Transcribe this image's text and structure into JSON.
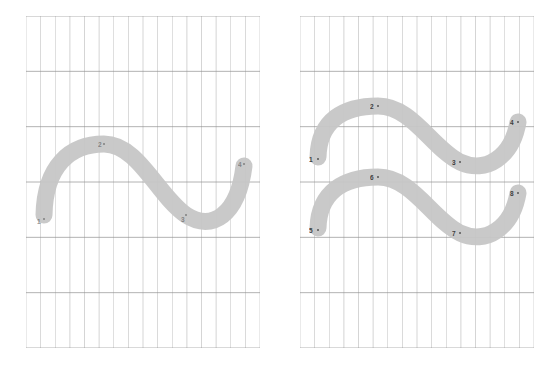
{
  "figure": {
    "type": "diagram",
    "background_color": "#ffffff",
    "grid": {
      "minor_line_color": "#c9c9c9",
      "major_line_color": "#8f8f8f",
      "border_color": "#8f8f8f",
      "minor_line_width": 0.5,
      "major_line_width": 0.8
    },
    "stroke": {
      "fill_color": "#c6c6c6",
      "edge_color": "#bdbdbd",
      "width_px": 17
    }
  },
  "panels": [
    {
      "id": "left-panel",
      "name": "left-panel",
      "x": 26,
      "y": 16,
      "width": 234,
      "height": 332,
      "columns": 16,
      "rows": 6,
      "curves": [
        {
          "id": "left-curve-1",
          "name": "s-curve",
          "path": "M 18,199 C 19,150 44,128 78,128 C 112,128 132,180 160,199 C 186,216 212,199 218,150",
          "points": [
            {
              "label": "1",
              "x": 18,
              "y": 203,
              "label_x": 11,
              "label_y": 203,
              "faint": true
            },
            {
              "label": "2",
              "x": 78,
              "y": 128,
              "label_x": 72,
              "label_y": 126,
              "faint": true
            },
            {
              "label": "3",
              "x": 160,
              "y": 199,
              "label_x": 155,
              "label_y": 201,
              "faint": true
            },
            {
              "label": "4",
              "x": 218,
              "y": 148,
              "label_x": 212,
              "label_y": 146,
              "faint": true
            }
          ]
        }
      ]
    },
    {
      "id": "right-panel",
      "name": "right-panel",
      "x": 300,
      "y": 16,
      "width": 234,
      "height": 332,
      "columns": 16,
      "rows": 6,
      "curves": [
        {
          "id": "right-curve-upper",
          "name": "s-curve-upper",
          "path": "M 18,141 C 19,104 44,90 78,90 C 112,90 132,132 160,146 C 186,158 212,141 218,106",
          "points": [
            {
              "label": "1",
              "x": 18,
              "y": 143,
              "label_x": 9,
              "label_y": 141,
              "faint": false
            },
            {
              "label": "2",
              "x": 78,
              "y": 90,
              "label_x": 70,
              "label_y": 88,
              "faint": false
            },
            {
              "label": "3",
              "x": 160,
              "y": 146,
              "label_x": 152,
              "label_y": 144,
              "faint": false
            },
            {
              "label": "4",
              "x": 218,
              "y": 106,
              "label_x": 210,
              "label_y": 104,
              "faint": false
            }
          ]
        },
        {
          "id": "right-curve-lower",
          "name": "s-curve-lower",
          "path": "M 18,212 C 19,176 44,161 78,161 C 112,161 132,203 160,217 C 186,229 212,212 218,177",
          "points": [
            {
              "label": "5",
              "x": 18,
              "y": 214,
              "label_x": 9,
              "label_y": 212,
              "faint": false
            },
            {
              "label": "6",
              "x": 78,
              "y": 161,
              "label_x": 70,
              "label_y": 159,
              "faint": false
            },
            {
              "label": "7",
              "x": 160,
              "y": 217,
              "label_x": 152,
              "label_y": 215,
              "faint": false
            },
            {
              "label": "8",
              "x": 218,
              "y": 177,
              "label_x": 210,
              "label_y": 175,
              "faint": false
            }
          ]
        }
      ]
    }
  ]
}
